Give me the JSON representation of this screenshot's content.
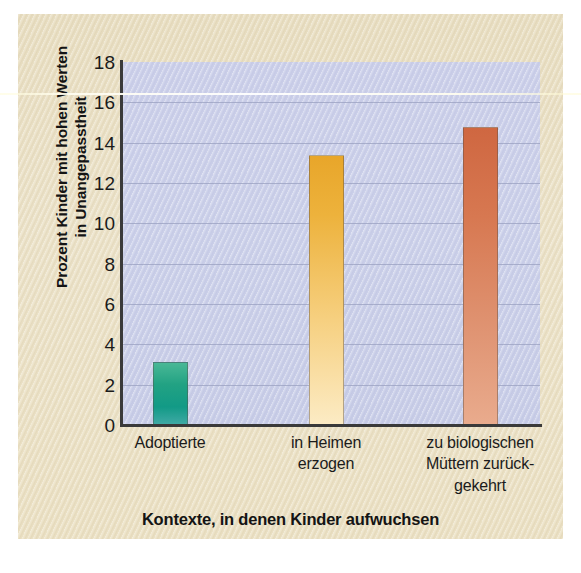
{
  "chart_data": {
    "type": "bar",
    "title": "",
    "categories": [
      "Adoptierte",
      "in Heimen\nerzogen",
      "zu biologischen\nMüttern zurück-\ngekehrt"
    ],
    "category_lines": [
      [
        "Adoptierte"
      ],
      [
        "in Heimen",
        "erzogen"
      ],
      [
        "zu biologischen",
        "Müttern zurück-",
        "gekehrt"
      ]
    ],
    "values": [
      3.1,
      13.4,
      14.8
    ],
    "xlabel": "Kontexte, in denen Kinder aufwuchsen",
    "ylabel": "Prozent Kinder mit hohen Werten\nin Unangepasstheit",
    "ylabel_lines": [
      "Prozent Kinder mit hohen Werten",
      "in Unangepasstheit"
    ],
    "ylim": [
      0,
      18
    ],
    "ytick_step": 2,
    "yticks": [
      "0",
      "2",
      "4",
      "6",
      "8",
      "10",
      "12",
      "14",
      "16",
      "18"
    ],
    "grid": true,
    "legend": "none",
    "bar_colors": [
      "#12a086",
      "#e8a62a",
      "#cf6741"
    ],
    "plot_bg": "#ccd0ea",
    "page_bg": "#ebe2c8",
    "axis_color": "#3a3a3a",
    "gridline_color": "#9aa0c0"
  }
}
